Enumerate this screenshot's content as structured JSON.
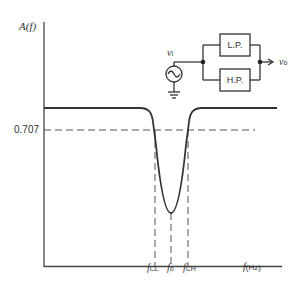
{
  "axes": {
    "y_label": "A(f)",
    "x_label_var": "f",
    "x_label_unit": "(Hz)",
    "y_tick": "0.707"
  },
  "frequency_markers": [
    {
      "var": "f",
      "sub": "CL"
    },
    {
      "var": "f",
      "sub": "o"
    },
    {
      "var": "f",
      "sub": "CH"
    }
  ],
  "circuit": {
    "input_label": "v",
    "input_sub": "i",
    "output_label": "v",
    "output_sub": "o",
    "low_pass": "L.P.",
    "high_pass": "H.P."
  },
  "colors": {
    "line": "#333333",
    "dashed": "#555555"
  }
}
